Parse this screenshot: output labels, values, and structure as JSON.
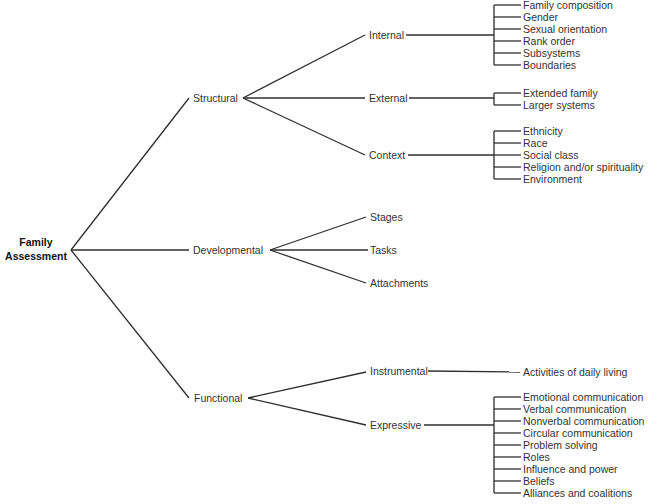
{
  "root": {
    "line1": "Family",
    "line2": "Assessment"
  },
  "categories": {
    "structural": {
      "label": "Structural",
      "internal": {
        "label": "Internal",
        "items": [
          "Family composition",
          "Gender",
          "Sexual orientation",
          "Rank order",
          "Subsystems",
          "Boundaries"
        ]
      },
      "external": {
        "label": "External",
        "items": [
          "Extended family",
          "Larger systems"
        ]
      },
      "context": {
        "label": "Context",
        "items": [
          "Ethnicity",
          "Race",
          "Social class",
          "Religion and/or spirituality",
          "Environment"
        ]
      }
    },
    "developmental": {
      "label": "Developmental",
      "items": [
        "Stages",
        "Tasks",
        "Attachments"
      ]
    },
    "functional": {
      "label": "Functional",
      "instrumental": {
        "label": "Instrumental",
        "items": [
          "Activities of daily living"
        ]
      },
      "expressive": {
        "label": "Expressive",
        "items": [
          "Emotional communication",
          "Verbal communication",
          "Nonverbal communication",
          "Circular communication",
          "Problem solving",
          "Roles",
          "Influence and power",
          "Beliefs",
          "Alliances and coalitions"
        ]
      }
    }
  }
}
